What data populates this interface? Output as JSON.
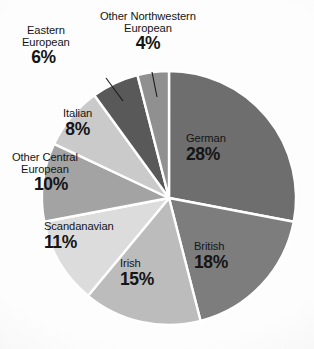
{
  "chart_data": {
    "type": "pie",
    "title": "",
    "subtitle": "",
    "xlabel": "",
    "ylabel": "",
    "legend_position": "none",
    "grid": false,
    "units": "percent",
    "categories": [
      "German",
      "British",
      "Irish",
      "Scandanavian",
      "Other Central European",
      "Italian",
      "Eastern European",
      "Other Northwestern European"
    ],
    "values": [
      28,
      18,
      15,
      11,
      10,
      8,
      6,
      4
    ],
    "slices": [
      {
        "label": "German",
        "label_line1": "German",
        "label_line2": "",
        "value": 28,
        "percent_text": "28%",
        "color": "#6e6e6e",
        "start_angle_deg": 0,
        "end_angle_deg": 100.8,
        "leader": false
      },
      {
        "label": "British",
        "label_line1": "British",
        "label_line2": "",
        "value": 18,
        "percent_text": "18%",
        "color": "#7d7d7d",
        "start_angle_deg": 100.8,
        "end_angle_deg": 165.6,
        "leader": false
      },
      {
        "label": "Irish",
        "label_line1": "Irish",
        "label_line2": "",
        "value": 15,
        "percent_text": "15%",
        "color": "#bcbcbc",
        "start_angle_deg": 165.6,
        "end_angle_deg": 219.6,
        "leader": false
      },
      {
        "label": "Scandanavian",
        "label_line1": "Scandanavian",
        "label_line2": "",
        "value": 11,
        "percent_text": "11%",
        "color": "#dcdcdc",
        "start_angle_deg": 219.6,
        "end_angle_deg": 259.2,
        "leader": false
      },
      {
        "label": "Other Central European",
        "label_line1": "Other Central",
        "label_line2": "European",
        "value": 10,
        "percent_text": "10%",
        "color": "#a3a3a3",
        "start_angle_deg": 259.2,
        "end_angle_deg": 295.2,
        "leader": false
      },
      {
        "label": "Italian",
        "label_line1": "Italian",
        "label_line2": "",
        "value": 8,
        "percent_text": "8%",
        "color": "#cacaca",
        "start_angle_deg": 295.2,
        "end_angle_deg": 324.0,
        "leader": false
      },
      {
        "label": "Eastern European",
        "label_line1": "Eastern",
        "label_line2": "European",
        "value": 6,
        "percent_text": "6%",
        "color": "#595959",
        "start_angle_deg": 324.0,
        "end_angle_deg": 345.6,
        "leader": true
      },
      {
        "label": "Other Northwestern European",
        "label_line1": "Other Northwestern",
        "label_line2": "European",
        "value": 4,
        "percent_text": "4%",
        "color": "#909090",
        "start_angle_deg": 345.6,
        "end_angle_deg": 360.0,
        "leader": true
      }
    ],
    "geometry": {
      "center_x": 169,
      "center_y": 198,
      "radius": 127,
      "separator_color": "#ffffff",
      "separator_width": 2.4
    },
    "background_color": "#fdfdfd",
    "text_color": "#151515"
  }
}
